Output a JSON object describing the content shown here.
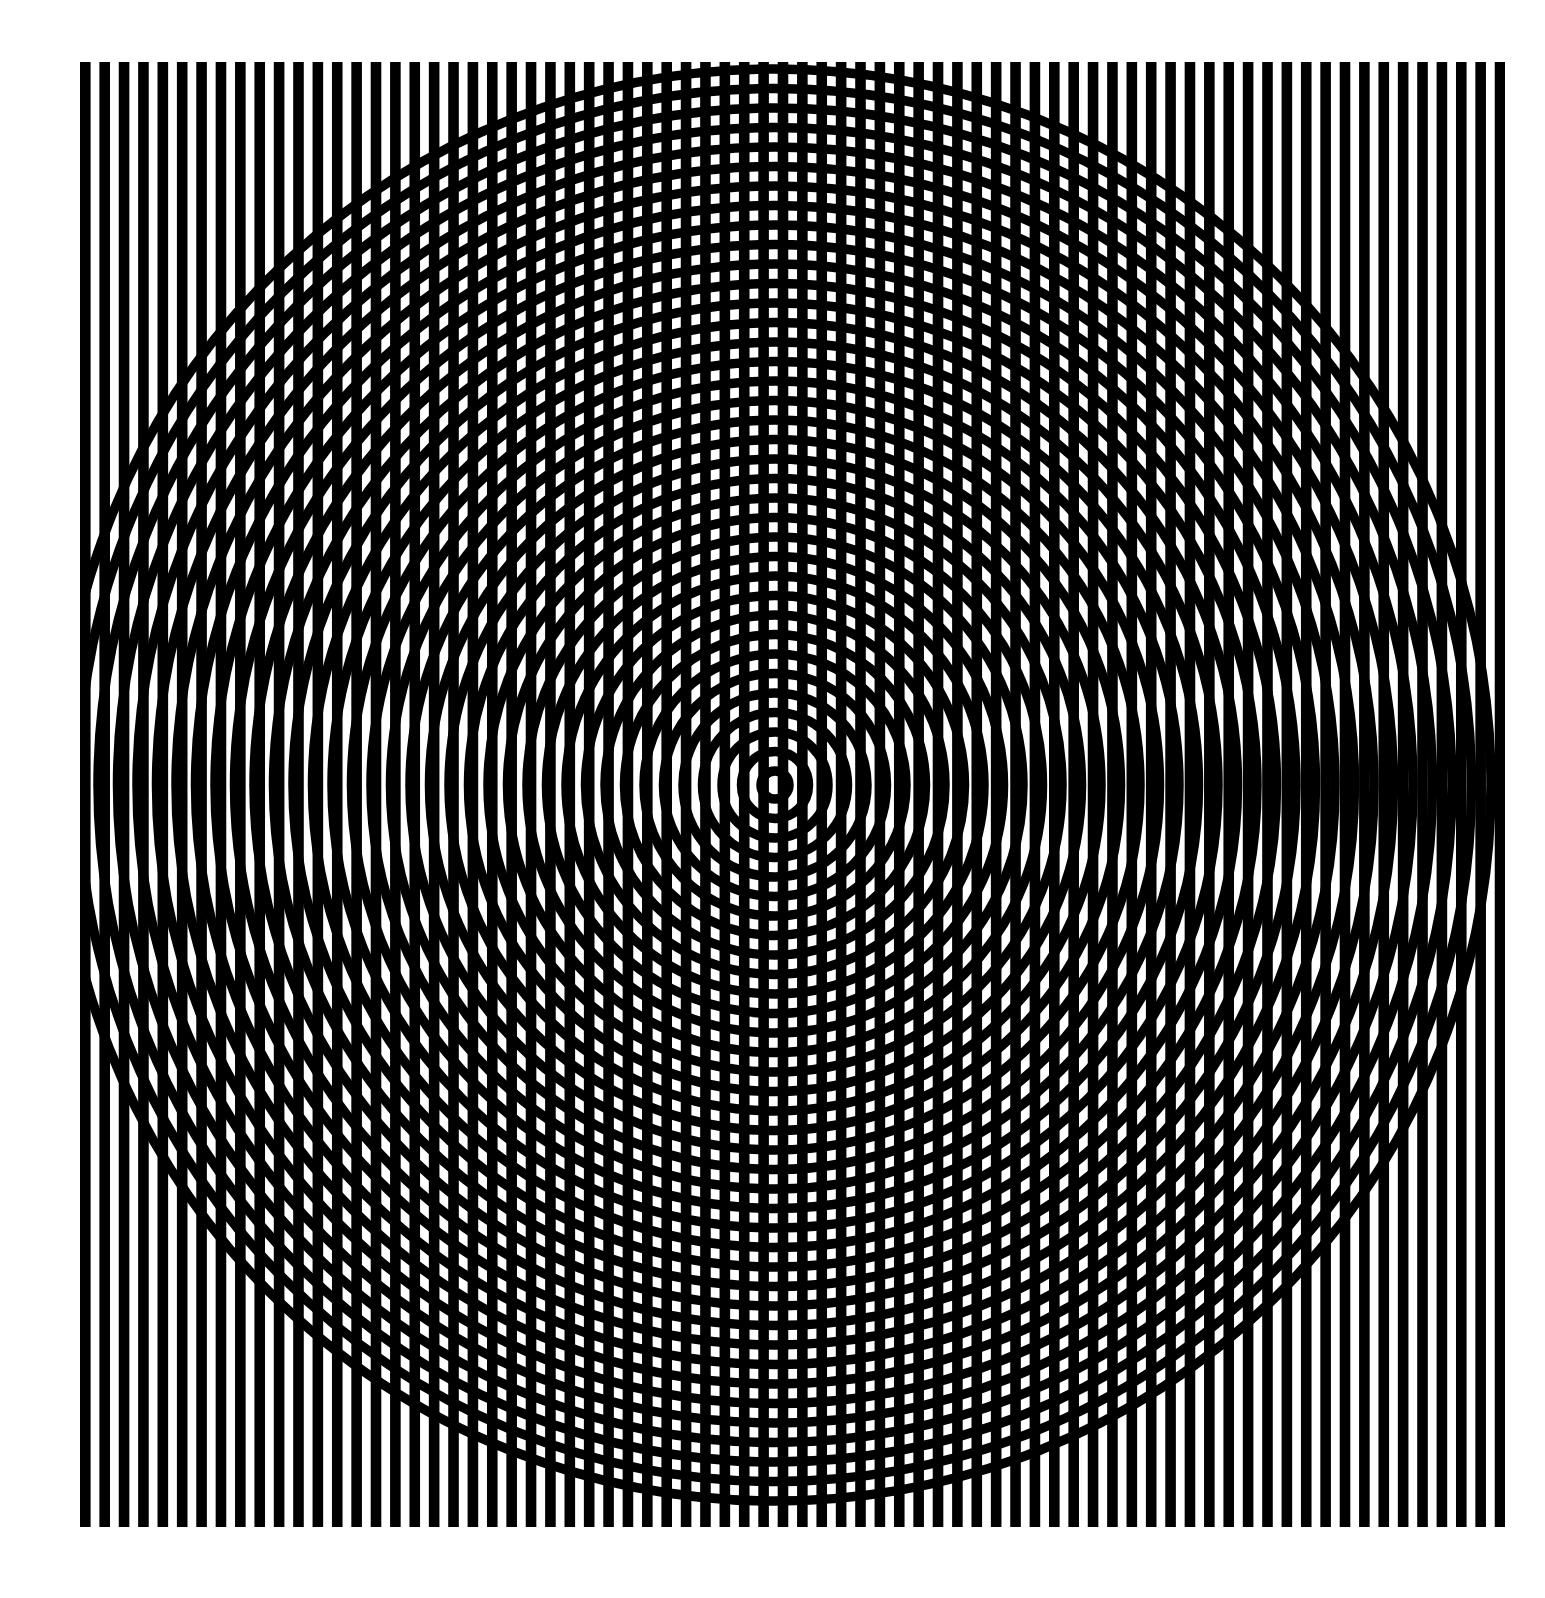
{
  "artwork": {
    "title": "Moire Interference Plate",
    "kind": "optical-art-print",
    "medium": "black ink on white paper",
    "canvas": {
      "width": 1545,
      "height": 1598
    },
    "colors": {
      "background": "#ffffff",
      "ink": "#000000",
      "paper": "#ffffff"
    }
  },
  "chart_data": {
    "type": "line",
    "subtitle": "Vertical line grating superimposed on a concentric circle grating",
    "xlabel": "",
    "ylabel": "",
    "grid": false,
    "legend": "none",
    "xlim": [
      0,
      1545
    ],
    "ylim": [
      0,
      1598
    ],
    "annotations": [],
    "series": [
      {
        "name": "vertical-grating",
        "geometry": "parallel-vertical-lines",
        "ink": "#000000",
        "x_start": 80,
        "x_end": 1505,
        "y_top": 62,
        "y_bottom": 1527,
        "period": 19.38,
        "line_width": 10.6,
        "gap_width": 8.8,
        "count": 74
      },
      {
        "name": "concentric-circle-grating",
        "geometry": "concentric-circles",
        "ink": "#000000",
        "center_x": 775,
        "center_y": 785,
        "radial_period": 19.5,
        "line_width": 9.5,
        "innermost_radius": 14,
        "outermost_radius": 735,
        "count": 38
      }
    ],
    "clip": {
      "shape": "rect",
      "x": 80,
      "y": 62,
      "width": 1425,
      "height": 1465
    }
  }
}
